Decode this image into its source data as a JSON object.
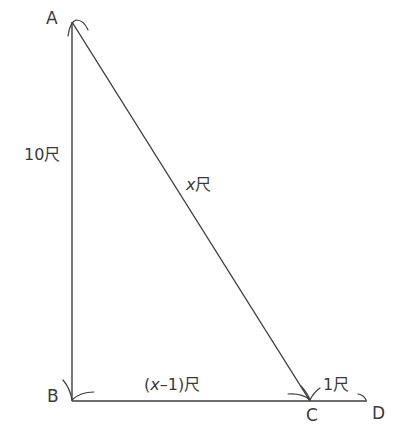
{
  "diagram": {
    "type": "right-triangle",
    "points": {
      "A": {
        "label": "A"
      },
      "B": {
        "label": "B"
      },
      "C": {
        "label": "C"
      },
      "D": {
        "label": "D"
      }
    },
    "lengths": {
      "AB": "10尺",
      "AC_var": "x",
      "AC_unit": "尺",
      "BC_open": "(",
      "BC_var": "x",
      "BC_rest": "–1)尺",
      "CD": "1尺"
    },
    "colors": {
      "stroke": "#3d3d3d",
      "text": "#3a3a3a",
      "background": "#ffffff"
    }
  }
}
